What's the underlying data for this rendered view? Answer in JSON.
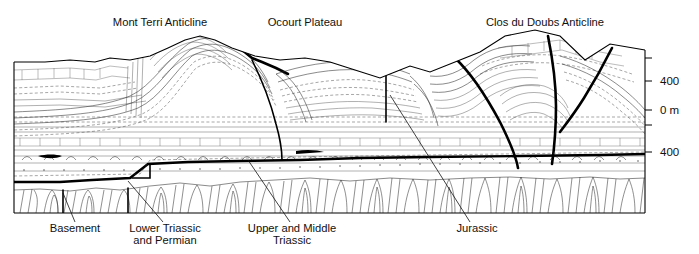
{
  "figure": {
    "type": "geological-cross-section",
    "title_labels_top": [
      {
        "id": "mont-terri",
        "text": "Mont Terri Anticline",
        "x": 160,
        "y": 26
      },
      {
        "id": "ocourt",
        "text": "Ocourt Plateau",
        "x": 305,
        "y": 26
      },
      {
        "id": "clos-du-doubs",
        "text": "Clos du Doubs Anticline",
        "x": 545,
        "y": 26
      }
    ],
    "unit_labels_bottom": [
      {
        "id": "basement",
        "lines": [
          "Basement"
        ],
        "x": 75,
        "y": 232,
        "leader": [
          [
            75,
            222
          ],
          [
            63,
            193
          ]
        ]
      },
      {
        "id": "lower-triassic-permian",
        "lines": [
          "Lower Triassic",
          "and Permian"
        ],
        "x": 165,
        "y": 232,
        "leader": [
          [
            163,
            222
          ],
          [
            128,
            181
          ]
        ]
      },
      {
        "id": "upper-middle-triassic",
        "lines": [
          "Upper and Middle",
          "Triassic"
        ],
        "x": 292,
        "y": 232,
        "leader": [
          [
            290,
            222
          ],
          [
            248,
            160
          ]
        ]
      },
      {
        "id": "jurassic",
        "lines": [
          "Jurassic"
        ],
        "x": 477,
        "y": 232,
        "leader": [
          [
            470,
            222
          ],
          [
            390,
            95
          ]
        ]
      }
    ],
    "scale": {
      "axis_x": 645,
      "axis_top_y": 50,
      "axis_bottom_y": 213,
      "ticks": [
        {
          "y": 58,
          "label": ""
        },
        {
          "y": 81,
          "label": "400"
        },
        {
          "y": 110,
          "label": "0 m"
        },
        {
          "y": 125,
          "label": ""
        },
        {
          "y": 152,
          "label": "400"
        }
      ],
      "label_x": 660,
      "unit": "m"
    },
    "frame": {
      "left": 14,
      "right": 645,
      "bottom": 213
    },
    "colors": {
      "ink": "#000000",
      "strata_line": "#2b2b2b",
      "fault": "#000000",
      "background": "#ffffff"
    },
    "structures": [
      {
        "name": "Mont Terri Anticline",
        "type": "anticline",
        "center_x": 175
      },
      {
        "name": "Ocourt Plateau",
        "type": "plateau",
        "center_x": 305
      },
      {
        "name": "Clos du Doubs Anticline",
        "type": "anticline",
        "center_x": 545
      }
    ],
    "stratigraphic_units": [
      "Jurassic",
      "Upper and Middle Triassic",
      "Lower Triassic and Permian",
      "Basement"
    ]
  }
}
